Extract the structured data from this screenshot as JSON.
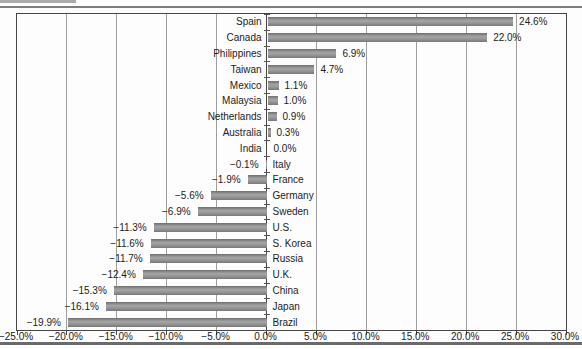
{
  "colors": {
    "bar": "#8c8c8c",
    "gridline": "#9e9e9e",
    "axis_frame": "#454545",
    "text": "#1c1c1c",
    "top_rule": "#7e7e7e",
    "bottom_rule": "#6b6b6b",
    "background": "#fdfdfd"
  },
  "chart_data": {
    "type": "bar",
    "orientation": "horizontal",
    "title": "",
    "xlabel": "",
    "ylabel": "",
    "legend": null,
    "grid": true,
    "xlim": [
      -25,
      30
    ],
    "categories": [
      "Spain",
      "Canada",
      "Philippines",
      "Taiwan",
      "Mexico",
      "Malaysia",
      "Netherlands",
      "Australia",
      "India",
      "Italy",
      "France",
      "Germany",
      "Sweden",
      "U.S.",
      "S. Korea",
      "Russia",
      "U.K.",
      "China",
      "Japan",
      "Brazil"
    ],
    "values": [
      24.6,
      22.0,
      6.9,
      4.7,
      1.1,
      1.0,
      0.9,
      0.3,
      0.0,
      -0.1,
      -1.9,
      -5.6,
      -6.9,
      -11.3,
      -11.6,
      -11.7,
      -12.4,
      -15.3,
      -16.1,
      -19.9
    ],
    "value_labels": [
      "24.6%",
      "22.0%",
      "6.9%",
      "4.7%",
      "1.1%",
      "1.0%",
      "0.9%",
      "0.3%",
      "0.0%",
      "−0.1%",
      "−1.9%",
      "−5.6%",
      "−6.9%",
      "−11.3%",
      "−11.6%",
      "−11.7%",
      "−12.4%",
      "−15.3%",
      "−16.1%",
      "−19.9%"
    ],
    "x_ticks": [
      -25,
      -20,
      -15,
      -10,
      -5,
      0,
      5,
      10,
      15,
      20,
      25,
      30
    ],
    "x_tick_labels": [
      "−25.0%",
      "−20.0%",
      "−15.0%",
      "−10.0%",
      "−5.0%",
      "0.0%",
      "5.0%",
      "10.0%",
      "15.0%",
      "20.0%",
      "25.0%",
      "30.0%"
    ]
  }
}
